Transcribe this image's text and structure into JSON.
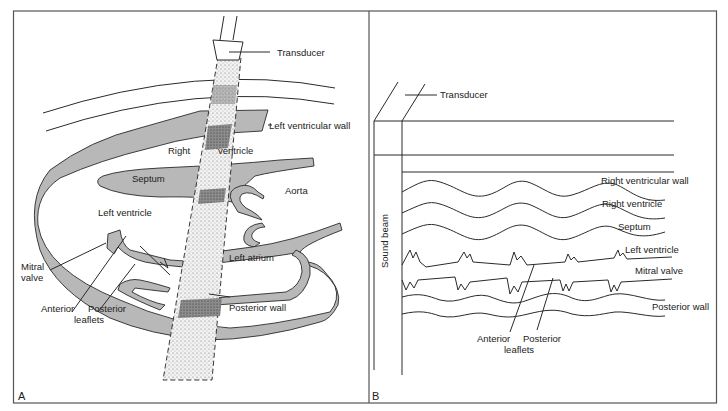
{
  "figure": {
    "panels": [
      {
        "id": "A",
        "letter": "A",
        "labels": {
          "transducer": "Transducer",
          "left_ventricular_wall": "Left ventricular wall",
          "right": "Right",
          "ventricle": "ventricle",
          "septum": "Septum",
          "aorta": "Aorta",
          "left_ventricle": "Left ventricle",
          "left_atrium": "Left atrium",
          "mitral": "Mitral",
          "valve": "valve",
          "anterior": "Anterior",
          "posterior": "Posterior",
          "leaflets": "leaflets",
          "posterior_wall": "Posterior wall"
        }
      },
      {
        "id": "B",
        "letter": "B",
        "labels": {
          "transducer": "Transducer",
          "sound_beam": "Sound beam",
          "right_ventricular_wall": "Right ventricular wall",
          "right_ventricle": "Right ventricle",
          "septum": "Septum",
          "left_ventricle": "Left ventricle",
          "mitral_valve": "Mitral valve",
          "posterior_wall": "Posterior wall",
          "anterior": "Anterior",
          "posterior": "Posterior",
          "leaflets": "leaflets"
        }
      }
    ],
    "colors": {
      "tissue": "#b8b8b8",
      "ink": "#2a2a2a",
      "background": "#ffffff"
    }
  }
}
